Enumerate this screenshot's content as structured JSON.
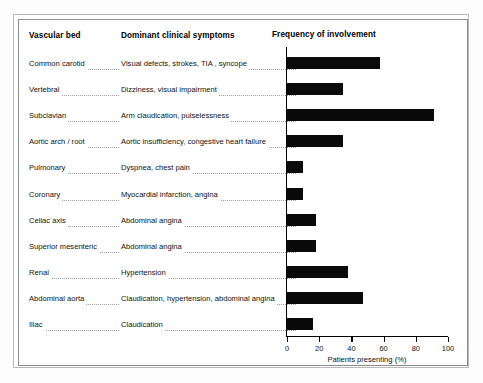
{
  "figure": {
    "columns": {
      "vascular_bed": "Vascular bed",
      "symptoms": "Dominant clinical symptoms",
      "frequency": "Frequency of involvement"
    },
    "rows": [
      {
        "bed": "Common carotid",
        "symptom": "Visual defects, strokes, TIA , syncope"
      },
      {
        "bed": "Vertebral",
        "symptom": "Dizziness, visual impairment"
      },
      {
        "bed": "Subclavian",
        "symptom": "Arm claudication, pulselessness"
      },
      {
        "bed": "Aortic arch / root",
        "symptom": "Aortic insufficiency, congestive heart failure"
      },
      {
        "bed": "Pulmonary",
        "symptom": "Dyspnea, chest pain"
      },
      {
        "bed": "Coronary",
        "symptom": "Myocardial infarction, angina"
      },
      {
        "bed": "Celiac axis",
        "symptom": "Abdominal angina"
      },
      {
        "bed": "Superior mesenteric",
        "symptom": "Abdominal angina"
      },
      {
        "bed": "Renal",
        "symptom": "Hypertension"
      },
      {
        "bed": "Abdominal aorta",
        "symptom": "Claudication, hypertension, abdominal angina"
      },
      {
        "bed": "Iliac",
        "symptom": "Claudication"
      }
    ]
  },
  "chart_data": {
    "type": "bar",
    "orientation": "horizontal",
    "title": "Frequency of involvement",
    "xlabel": "Patients presenting (%)",
    "ylabel": "",
    "xlim": [
      0,
      100
    ],
    "xticks": [
      0,
      20,
      40,
      60,
      80,
      100
    ],
    "grid": false,
    "legend": null,
    "bar_color": "#0a0a0a",
    "categories": [
      "Common carotid",
      "Vertebral",
      "Subclavian",
      "Aortic arch / root",
      "Pulmonary",
      "Coronary",
      "Celiac axis",
      "Superior mesenteric",
      "Renal",
      "Abdominal aorta",
      "Iliac"
    ],
    "values": [
      58,
      35,
      91,
      35,
      10,
      10,
      18,
      18,
      38,
      47,
      16
    ]
  }
}
